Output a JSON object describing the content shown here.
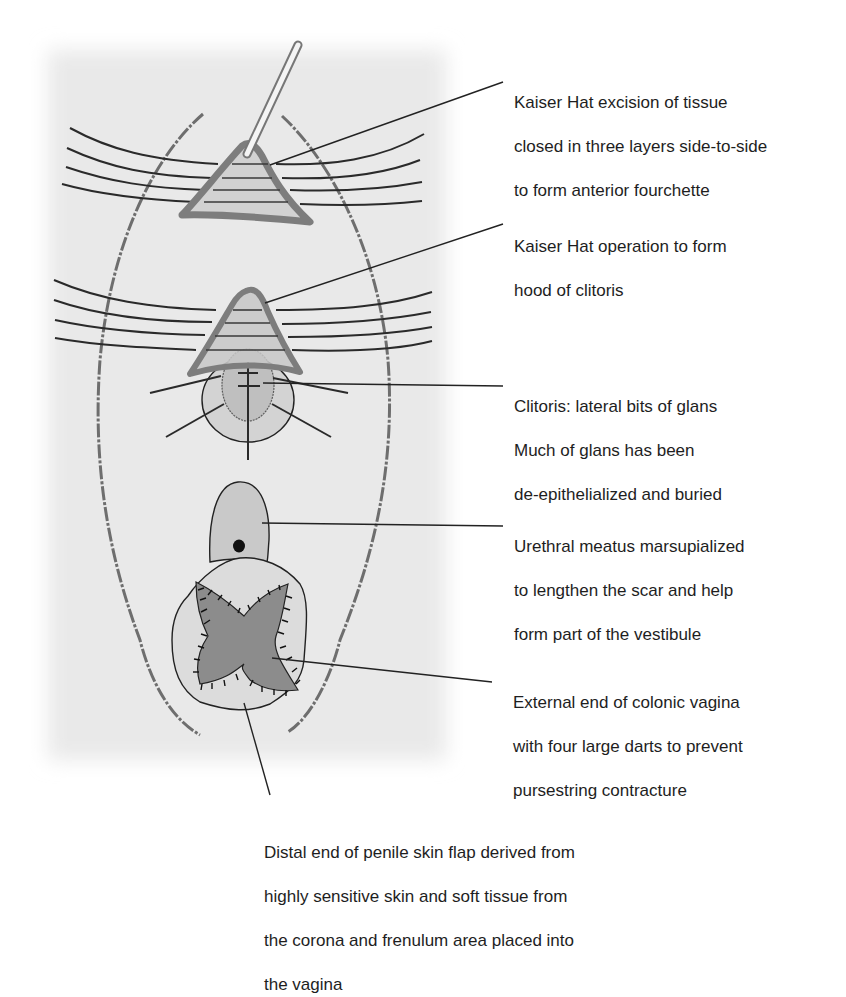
{
  "figure": {
    "colors": {
      "background_field": "#e9e9e9",
      "tissue_light": "#d2d2d2",
      "tissue_mid": "#bdbdbd",
      "tissue_dark": "#8c8c8c",
      "outline": "#222222",
      "hat_border": "#7d7d7d"
    }
  },
  "labels": [
    {
      "id": "kaiser-hat-excision",
      "lines": [
        "Kaiser Hat excision of tissue",
        "closed in three layers side-to-side",
        "to form anterior fourchette"
      ]
    },
    {
      "id": "kaiser-hat-hood",
      "lines": [
        "Kaiser Hat operation to form",
        "hood of clitoris"
      ]
    },
    {
      "id": "clitoris",
      "lines": [
        "Clitoris: lateral bits of glans",
        "Much of glans has been",
        "de-epithelialized and buried"
      ]
    },
    {
      "id": "urethral-meatus",
      "lines": [
        "Urethral meatus marsupialized",
        "to lengthen the scar and help",
        "form part of the vestibule"
      ]
    },
    {
      "id": "colonic-vagina",
      "lines": [
        "External end of colonic vagina",
        "with four large darts to prevent",
        "pursestring contracture"
      ]
    },
    {
      "id": "penile-skin-flap",
      "lines": [
        "Distal end of penile skin flap derived from",
        "highly sensitive skin and soft tissue from",
        "the corona and frenulum area placed into",
        "the vagina"
      ]
    }
  ]
}
